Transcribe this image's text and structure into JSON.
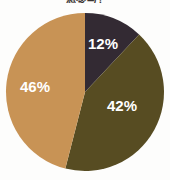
{
  "chart_data": {
    "type": "pie",
    "title": "想参与?",
    "xlabel": "",
    "ylabel": "",
    "categories": [
      "Segment 1",
      "Segment 2",
      "Segment 3"
    ],
    "values": [
      12,
      42,
      46
    ],
    "value_labels": [
      "12%",
      "42%",
      "46%"
    ],
    "unit": "%",
    "start_angle_deg": 0,
    "direction": "clockwise",
    "legend": "none",
    "grid": false,
    "colors": [
      "#332a33",
      "#574c22",
      "#c89355"
    ],
    "label_color": "#ffffff",
    "background": "#fdfdfc",
    "slices": [
      {
        "label": "12%",
        "value": 12,
        "color": "#332a33",
        "start_deg": 0.0,
        "end_deg": 43.2,
        "label_x": 103,
        "label_y": 45
      },
      {
        "label": "42%",
        "value": 42,
        "color": "#574c22",
        "start_deg": 43.2,
        "end_deg": 194.4,
        "label_x": 122,
        "label_y": 107
      },
      {
        "label": "46%",
        "value": 46,
        "color": "#c89355",
        "start_deg": 194.4,
        "end_deg": 360.0,
        "label_x": 35,
        "label_y": 88
      }
    ]
  }
}
